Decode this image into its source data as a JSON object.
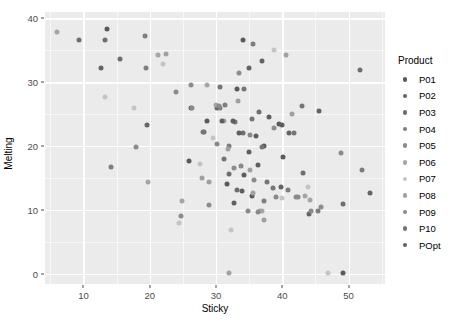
{
  "chart_data": {
    "type": "scatter",
    "title": "",
    "xlabel": "Sticky",
    "ylabel": "Melting",
    "xlim": [
      4.2,
      55.5
    ],
    "ylim": [
      -1.6,
      41.0
    ],
    "xticks": [
      10,
      20,
      30,
      40,
      50
    ],
    "yticks": [
      0,
      10,
      20,
      30,
      40
    ],
    "grid": true,
    "legend_position": "right",
    "legend_title": "Product",
    "panel_background": "#ebebeb",
    "gridline_color": "#ffffff",
    "series": [
      {
        "name": "P01",
        "color": "#5a5a5a",
        "points": [
          {
            "x": 13.6,
            "y": 38.4
          },
          {
            "x": 34.0,
            "y": 36.6
          },
          {
            "x": 39.5,
            "y": 23.5
          },
          {
            "x": 33.2,
            "y": 29.0
          },
          {
            "x": 31.6,
            "y": 14.1
          },
          {
            "x": 37.2,
            "y": 20.0
          },
          {
            "x": 25.9,
            "y": 17.6
          },
          {
            "x": 28.7,
            "y": 23.9
          },
          {
            "x": 40.1,
            "y": 18.3
          },
          {
            "x": 49.2,
            "y": 0.2
          },
          {
            "x": 35.5,
            "y": 12.2
          }
        ]
      },
      {
        "name": "P02",
        "color": "#646464",
        "points": [
          {
            "x": 12.6,
            "y": 32.2
          },
          {
            "x": 19.6,
            "y": 23.3
          },
          {
            "x": 30.2,
            "y": 25.9
          },
          {
            "x": 37.0,
            "y": 33.4
          },
          {
            "x": 35.0,
            "y": 32.3
          },
          {
            "x": 41.0,
            "y": 22.0
          },
          {
            "x": 44.0,
            "y": 9.3
          },
          {
            "x": 26.3,
            "y": 25.9
          },
          {
            "x": 39.8,
            "y": 13.6
          },
          {
            "x": 45.5,
            "y": 25.5
          },
          {
            "x": 53.2,
            "y": 12.7
          }
        ]
      },
      {
        "name": "P03",
        "color": "#6e6e6e",
        "points": [
          {
            "x": 9.4,
            "y": 36.6
          },
          {
            "x": 15.5,
            "y": 33.6
          },
          {
            "x": 13.3,
            "y": 36.6
          },
          {
            "x": 31.9,
            "y": 15.6
          },
          {
            "x": 34.0,
            "y": 22.1
          },
          {
            "x": 43.1,
            "y": 15.8
          },
          {
            "x": 36.5,
            "y": 25.3
          },
          {
            "x": 28.2,
            "y": 22.2
          },
          {
            "x": 49.1,
            "y": 11.0
          },
          {
            "x": 33.2,
            "y": 13.1
          },
          {
            "x": 51.7,
            "y": 31.9
          }
        ]
      },
      {
        "name": "P04",
        "color": "#7d7d7d",
        "points": [
          {
            "x": 14.2,
            "y": 16.8
          },
          {
            "x": 19.5,
            "y": 32.2
          },
          {
            "x": 19.3,
            "y": 37.2
          },
          {
            "x": 30.6,
            "y": 25.9
          },
          {
            "x": 40.8,
            "y": 13.2
          },
          {
            "x": 45.4,
            "y": 9.8
          },
          {
            "x": 37.3,
            "y": 11.4
          },
          {
            "x": 32.0,
            "y": 20.0
          },
          {
            "x": 31.3,
            "y": 26.4
          },
          {
            "x": 35.6,
            "y": 36.0
          },
          {
            "x": 52.0,
            "y": 16.3
          }
        ]
      },
      {
        "name": "P05",
        "color": "#8c8c8c",
        "points": [
          {
            "x": 17.9,
            "y": 19.9
          },
          {
            "x": 24.7,
            "y": 9.0
          },
          {
            "x": 24.0,
            "y": 28.4
          },
          {
            "x": 29.0,
            "y": 10.8
          },
          {
            "x": 32.7,
            "y": 16.5
          },
          {
            "x": 42.0,
            "y": 12.1
          },
          {
            "x": 35.8,
            "y": 14.7
          },
          {
            "x": 33.5,
            "y": 31.4
          },
          {
            "x": 38.8,
            "y": 22.8
          },
          {
            "x": 45.9,
            "y": 10.4
          },
          {
            "x": 26.3,
            "y": 29.5
          }
        ]
      },
      {
        "name": "P06",
        "color": "#a5a5a5",
        "points": [
          {
            "x": 6.0,
            "y": 37.8
          },
          {
            "x": 19.8,
            "y": 14.4
          },
          {
            "x": 24.8,
            "y": 11.4
          },
          {
            "x": 28.6,
            "y": 29.5
          },
          {
            "x": 36.6,
            "y": 9.8
          },
          {
            "x": 31.2,
            "y": 24.0
          },
          {
            "x": 43.5,
            "y": 12.2
          },
          {
            "x": 37.0,
            "y": 9.8
          },
          {
            "x": 30.0,
            "y": 26.4
          },
          {
            "x": 44.2,
            "y": 11.5
          },
          {
            "x": 21.3,
            "y": 34.2
          }
        ]
      },
      {
        "name": "P07",
        "color": "#c4c4c4",
        "points": [
          {
            "x": 13.2,
            "y": 27.7
          },
          {
            "x": 17.6,
            "y": 25.9
          },
          {
            "x": 22.0,
            "y": 32.9
          },
          {
            "x": 24.4,
            "y": 7.9
          },
          {
            "x": 27.6,
            "y": 17.2
          },
          {
            "x": 29.5,
            "y": 21.2
          },
          {
            "x": 32.2,
            "y": 6.8
          },
          {
            "x": 38.8,
            "y": 35.0
          },
          {
            "x": 40.0,
            "y": 11.9
          },
          {
            "x": 46.9,
            "y": 0.2
          },
          {
            "x": 43.9,
            "y": 13.6
          }
        ]
      },
      {
        "name": "P08",
        "color": "#a0a0a0",
        "points": [
          {
            "x": 22.4,
            "y": 34.5
          },
          {
            "x": 29.0,
            "y": 14.4
          },
          {
            "x": 31.8,
            "y": 19.5
          },
          {
            "x": 35.2,
            "y": 16.2
          },
          {
            "x": 27.9,
            "y": 15.0
          },
          {
            "x": 35.6,
            "y": 12.6
          },
          {
            "x": 41.5,
            "y": 25.0
          },
          {
            "x": 31.9,
            "y": 0.1
          },
          {
            "x": 37.3,
            "y": 8.5
          },
          {
            "x": 33.3,
            "y": 27.0
          },
          {
            "x": 40.6,
            "y": 34.2
          }
        ]
      },
      {
        "name": "P09",
        "color": "#8a8a8a",
        "points": [
          {
            "x": 26.4,
            "y": 25.9
          },
          {
            "x": 30.5,
            "y": 26.2
          },
          {
            "x": 33.8,
            "y": 16.9
          },
          {
            "x": 36.4,
            "y": 9.7
          },
          {
            "x": 39.0,
            "y": 12.1
          },
          {
            "x": 42.3,
            "y": 12.0
          },
          {
            "x": 30.2,
            "y": 20.3
          },
          {
            "x": 44.4,
            "y": 9.9
          },
          {
            "x": 34.9,
            "y": 9.8
          },
          {
            "x": 48.8,
            "y": 18.9
          },
          {
            "x": 35.1,
            "y": 21.8
          }
        ]
      },
      {
        "name": "P10",
        "color": "#757575",
        "points": [
          {
            "x": 28.0,
            "y": 22.2
          },
          {
            "x": 32.9,
            "y": 23.7
          },
          {
            "x": 35.4,
            "y": 24.3
          },
          {
            "x": 36.9,
            "y": 19.8
          },
          {
            "x": 31.2,
            "y": 18.0
          },
          {
            "x": 38.6,
            "y": 13.5
          },
          {
            "x": 34.3,
            "y": 29.0
          },
          {
            "x": 30.6,
            "y": 29.2
          },
          {
            "x": 37.7,
            "y": 14.4
          },
          {
            "x": 43.0,
            "y": 26.2
          },
          {
            "x": 41.8,
            "y": 22.1
          }
        ]
      },
      {
        "name": "POpt",
        "color": "#5f5f5f",
        "points": [
          {
            "x": 33.5,
            "y": 22.0
          },
          {
            "x": 35.0,
            "y": 19.0
          },
          {
            "x": 36.3,
            "y": 17.0
          },
          {
            "x": 34.2,
            "y": 15.5
          },
          {
            "x": 32.5,
            "y": 24.0
          },
          {
            "x": 38.0,
            "y": 24.5
          },
          {
            "x": 30.9,
            "y": 23.9
          },
          {
            "x": 36.1,
            "y": 21.6
          },
          {
            "x": 33.9,
            "y": 12.9
          },
          {
            "x": 39.9,
            "y": 23.3
          },
          {
            "x": 32.7,
            "y": 11.1
          }
        ]
      }
    ]
  },
  "axes": {
    "x": {
      "title": "Sticky",
      "tick_labels": [
        "10",
        "20",
        "30",
        "40",
        "50"
      ]
    },
    "y": {
      "title": "Melting",
      "tick_labels": [
        "0",
        "10",
        "20",
        "30",
        "40"
      ]
    }
  },
  "legend": {
    "title": "Product",
    "items": [
      {
        "label": "P01",
        "color": "#5a5a5a"
      },
      {
        "label": "P02",
        "color": "#646464"
      },
      {
        "label": "P03",
        "color": "#6e6e6e"
      },
      {
        "label": "P04",
        "color": "#7d7d7d"
      },
      {
        "label": "P05",
        "color": "#8c8c8c"
      },
      {
        "label": "P06",
        "color": "#a5a5a5"
      },
      {
        "label": "P07",
        "color": "#c4c4c4"
      },
      {
        "label": "P08",
        "color": "#a0a0a0"
      },
      {
        "label": "P09",
        "color": "#8a8a8a"
      },
      {
        "label": "P10",
        "color": "#757575"
      },
      {
        "label": "POpt",
        "color": "#5f5f5f"
      }
    ]
  }
}
